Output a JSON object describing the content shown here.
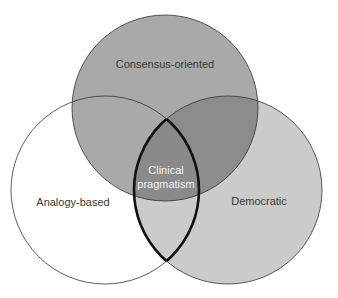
{
  "diagram": {
    "type": "venn-3",
    "sets": [
      {
        "id": "consensus",
        "label": "Consensus-oriented",
        "color": "#a9a9a9"
      },
      {
        "id": "analogy",
        "label": "Analogy-based",
        "color": "#ffffff"
      },
      {
        "id": "democratic",
        "label": "Democratic",
        "color": "#cbcbcb"
      }
    ],
    "intersections": {
      "consensus_democratic": {
        "color": "#8c8c8c"
      },
      "consensus_analogy": {
        "color": "#a9a9a9"
      },
      "analogy_democratic": {
        "color": "#cbcbcb"
      },
      "all": {
        "color": "#8a8a8a"
      }
    },
    "highlight": {
      "sets": [
        "analogy",
        "democratic"
      ],
      "label_line1": "Clinical",
      "label_line2": "pragmatism",
      "label_color": "#f2f2f2",
      "outline_color": "#111111"
    },
    "stroke_color": "#333333",
    "text_color": "#3a3a3a"
  }
}
